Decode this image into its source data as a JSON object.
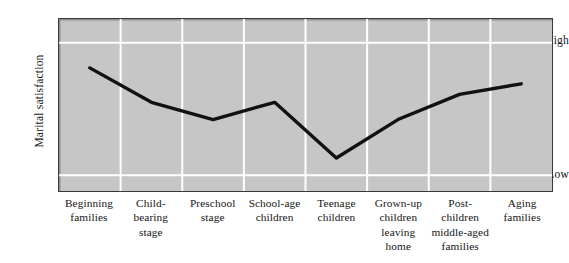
{
  "chart_data": {
    "type": "line",
    "title": "",
    "xlabel": "",
    "ylabel": "Marital satisfaction",
    "categories": [
      "Beginning\nfamilies",
      "Child-\nbearing\nstage",
      "Preschool\nstage",
      "School-age\nchildren",
      "Teenage\nchildren",
      "Grown-up\nchildren\nleaving\nhome",
      "Post-\nchildren\nmiddle-aged\nfamilies",
      "Aging\nfamilies"
    ],
    "values": [
      81,
      55,
      42,
      55,
      13,
      42,
      61,
      69
    ],
    "ytick_labels": [
      "High",
      "Low"
    ],
    "ylim": [
      0,
      100
    ],
    "grid": true,
    "legend": "none",
    "series": [
      {
        "name": "Marital satisfaction",
        "values": [
          81,
          55,
          42,
          55,
          13,
          42,
          61,
          69
        ]
      }
    ],
    "colors": {
      "plot_background": "#c6c6c6",
      "gridline": "#ffffff",
      "line": "#111111",
      "border": "#3a3a3a",
      "text": "#151515",
      "page_background": "#ffffff"
    }
  },
  "axis": {
    "y_title": "Marital satisfaction",
    "y_high_label": "High",
    "y_low_label": "Low"
  },
  "x_axis": {
    "labels": [
      {
        "line1": "Beginning",
        "line2": "families",
        "line3": "",
        "line4": ""
      },
      {
        "line1": "Child-",
        "line2": "bearing",
        "line3": "stage",
        "line4": ""
      },
      {
        "line1": "Preschool",
        "line2": "stage",
        "line3": "",
        "line4": ""
      },
      {
        "line1": "School-age",
        "line2": "children",
        "line3": "",
        "line4": ""
      },
      {
        "line1": "Teenage",
        "line2": "children",
        "line3": "",
        "line4": ""
      },
      {
        "line1": "Grown-up",
        "line2": "children",
        "line3": "leaving",
        "line4": "home"
      },
      {
        "line1": "Post-",
        "line2": "children",
        "line3": "middle-aged",
        "line4": "families"
      },
      {
        "line1": "Aging",
        "line2": "families",
        "line3": "",
        "line4": ""
      }
    ]
  }
}
